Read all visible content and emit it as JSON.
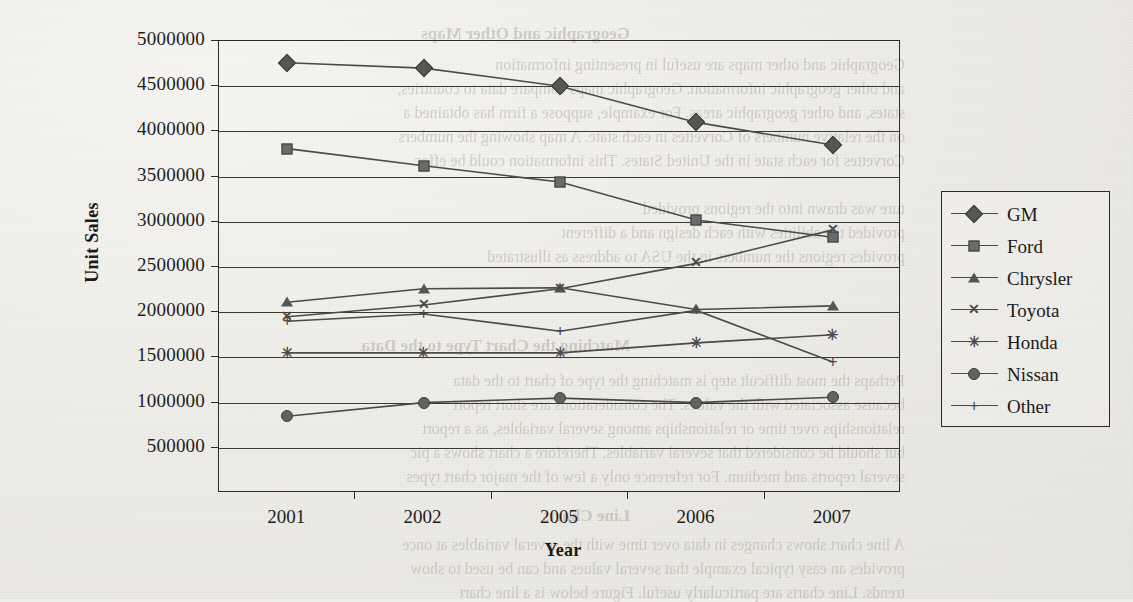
{
  "page": {
    "background_color": "#efeeea",
    "ink_color": "#1b1b1b",
    "bleed_through_lines": [
      {
        "text": "Geographic and Other Maps",
        "x": 630,
        "y": 24,
        "size": 17,
        "weight": "bold"
      },
      {
        "text": "Geographic and other maps are useful in presenting information",
        "x": 905,
        "y": 56,
        "size": 16,
        "weight": "normal"
      },
      {
        "text": "and other geographic information. Geographic maps compare data to countries,",
        "x": 905,
        "y": 80,
        "size": 16,
        "weight": "normal"
      },
      {
        "text": "states, and other geographic areas. For example, suppose a firm has obtained a",
        "x": 905,
        "y": 104,
        "size": 16,
        "weight": "normal"
      },
      {
        "text": "on the relative numbers of Corvettes in each state. A map showing the numbers",
        "x": 905,
        "y": 128,
        "size": 16,
        "weight": "normal"
      },
      {
        "text": "Corvettes for each state in the United States. This information could be effec",
        "x": 905,
        "y": 152,
        "size": 16,
        "weight": "normal"
      },
      {
        "text": "ture was drawn into the regions provided",
        "x": 905,
        "y": 200,
        "size": 16,
        "weight": "normal"
      },
      {
        "text": "provided the abilities with each design and a different",
        "x": 905,
        "y": 224,
        "size": 16,
        "weight": "normal"
      },
      {
        "text": "provides regions the numbers in the USA to address as illustrated",
        "x": 905,
        "y": 248,
        "size": 16,
        "weight": "normal"
      },
      {
        "text": "Matching the Chart Type to the Data",
        "x": 630,
        "y": 336,
        "size": 17,
        "weight": "bold"
      },
      {
        "text": "Perhaps the most difficult step is matching the type of chart to the data",
        "x": 905,
        "y": 372,
        "size": 16,
        "weight": "normal"
      },
      {
        "text": "because associated with the values. The considerations are short report",
        "x": 905,
        "y": 396,
        "size": 16,
        "weight": "normal"
      },
      {
        "text": "relationships over time or relationships among several variables, as a report",
        "x": 905,
        "y": 420,
        "size": 16,
        "weight": "normal"
      },
      {
        "text": "but should be considered that several variables. Therefore a chart shows a pic",
        "x": 905,
        "y": 444,
        "size": 16,
        "weight": "normal"
      },
      {
        "text": "several reports and medium. For reference only a few of the major chart types",
        "x": 905,
        "y": 468,
        "size": 16,
        "weight": "normal"
      },
      {
        "text": "Line Charts",
        "x": 630,
        "y": 506,
        "size": 17,
        "weight": "bold"
      },
      {
        "text": "A line chart shows changes in data over time with the several variables at once",
        "x": 905,
        "y": 536,
        "size": 16,
        "weight": "normal"
      },
      {
        "text": "provides an easy typical example that several values and can be used to show",
        "x": 905,
        "y": 560,
        "size": 16,
        "weight": "normal"
      },
      {
        "text": "trends. Line charts are particularly useful. Figure below is a line chart",
        "x": 905,
        "y": 584,
        "size": 16,
        "weight": "normal"
      }
    ]
  },
  "chart_data": {
    "type": "line",
    "title": "",
    "xlabel": "Year",
    "ylabel": "Unit Sales",
    "categories": [
      "2001",
      "2002",
      "2005",
      "2006",
      "2007"
    ],
    "ylim": [
      0,
      5000000
    ],
    "ytick_values": [
      500000,
      1000000,
      1500000,
      2000000,
      2500000,
      3000000,
      3500000,
      4000000,
      4500000,
      5000000
    ],
    "ytick_labels": [
      "500000",
      "1000000",
      "1500000",
      "2000000",
      "2500000",
      "3000000",
      "3500000",
      "4000000",
      "4500000",
      "5000000"
    ],
    "grid": true,
    "legend_position": "right",
    "series": [
      {
        "name": "GM",
        "marker": "diamond",
        "marker_icon": "diamond-marker-icon",
        "values": [
          4760000,
          4700000,
          4500000,
          4100000,
          3850000
        ]
      },
      {
        "name": "Ford",
        "marker": "square",
        "marker_icon": "square-marker-icon",
        "values": [
          3810000,
          3620000,
          3440000,
          3020000,
          2830000
        ]
      },
      {
        "name": "Chrysler",
        "marker": "triangle",
        "marker_icon": "triangle-marker-icon",
        "values": [
          2110000,
          2260000,
          2270000,
          2030000,
          2070000
        ]
      },
      {
        "name": "Toyota",
        "marker": "cross",
        "marker_icon": "cross-marker-icon",
        "values": [
          1950000,
          2080000,
          2260000,
          2540000,
          2910000
        ]
      },
      {
        "name": "Honda",
        "marker": "star",
        "marker_icon": "asterisk-marker-icon",
        "values": [
          1550000,
          1550000,
          1550000,
          1660000,
          1750000
        ]
      },
      {
        "name": "Nissan",
        "marker": "circle",
        "marker_icon": "circle-marker-icon",
        "values": [
          850000,
          1000000,
          1050000,
          1000000,
          1060000
        ]
      },
      {
        "name": "Other",
        "marker": "plus",
        "marker_icon": "plus-marker-icon",
        "values": [
          1900000,
          1980000,
          1790000,
          2020000,
          1450000
        ]
      }
    ]
  }
}
